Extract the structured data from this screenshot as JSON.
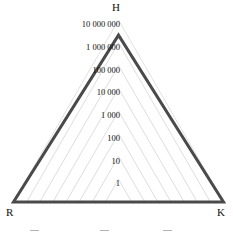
{
  "chart_data": {
    "type": "radar",
    "title": "",
    "subtitle": "",
    "xlabel": "",
    "ylabel": "",
    "scale": "log",
    "grid": true,
    "legend_position": "bottom",
    "axes": [
      {
        "key": "H",
        "label": "H",
        "angle_deg": 90
      },
      {
        "key": "R",
        "label": "R",
        "angle_deg": 210
      },
      {
        "key": "K",
        "label": "K",
        "angle_deg": 330
      }
    ],
    "categories": [
      "H",
      "R",
      "K"
    ],
    "tick_labels": [
      "10 000 000",
      "1 000 000",
      "100 000",
      "10 000",
      "1 000",
      "100",
      "10",
      "1"
    ],
    "tick_values": [
      10000000,
      1000000,
      100000,
      10000,
      1000,
      100,
      10,
      1
    ],
    "ring_count": 8,
    "ylim": [
      1,
      10000000
    ],
    "series": [
      {
        "name": "",
        "values": [
          1000000,
          10000000,
          10000000
        ],
        "level_indices": [
          6,
          7,
          7
        ],
        "color": "#4a4a4a",
        "line_width": 3
      }
    ],
    "colors": {
      "data_line": "#4a4a4a",
      "grid_line": "#cfcfcf",
      "outer_grid_line": "#d8d8d8",
      "text": "#111111",
      "background": "#ffffff",
      "legend_text": "#8d8d8d"
    }
  },
  "axis_labels": {
    "top": "H",
    "bottom_left": "R",
    "bottom_right": "K"
  },
  "ticks": [
    "10 000 000",
    "1 000 000",
    "100 000",
    "10 000",
    "1 000",
    "100",
    "10",
    "1"
  ],
  "legend": {
    "visible": true,
    "truncated": true,
    "items": [
      {
        "label": ""
      },
      {
        "label": ""
      },
      {
        "label": ""
      }
    ]
  }
}
